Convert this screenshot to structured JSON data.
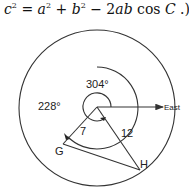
{
  "formula": {
    "c": "c",
    "exp": "2",
    "eq": " = ",
    "a": "a",
    "plus": " + ",
    "b": "b",
    "minus": " − 2",
    "ab": "ab",
    "cos": " cos ",
    "C": "C",
    "tail": " .)"
  },
  "diagram": {
    "angle_bearing_h": "304°",
    "angle_bearing_g": "228°",
    "distance_g": "7",
    "distance_h": "12",
    "point_g": "G",
    "point_h": "H",
    "direction": "East",
    "line_color": "#333333"
  }
}
